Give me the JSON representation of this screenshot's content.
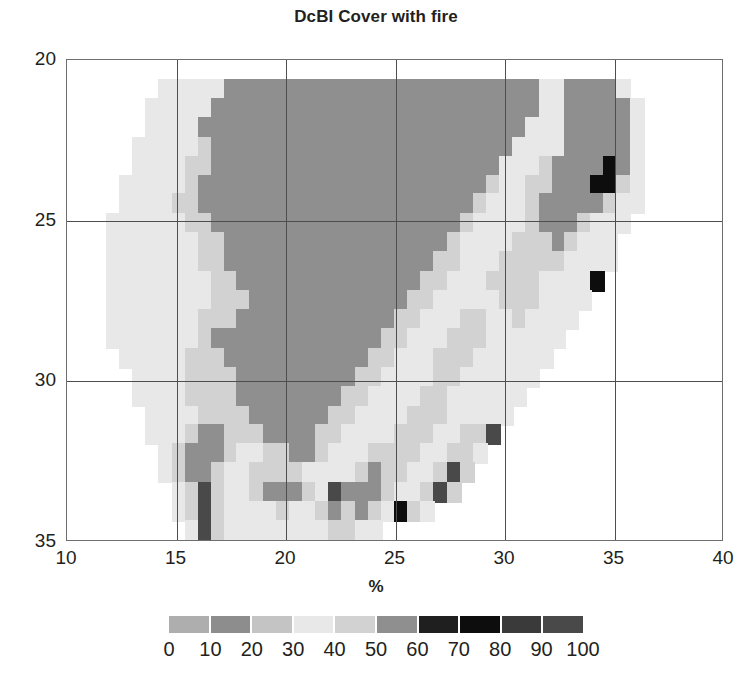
{
  "chart_data": {
    "type": "heatmap",
    "title": "DcBI Cover with fire",
    "xlabel": "%",
    "ylabel": "",
    "xlim": [
      10,
      40
    ],
    "ylim": [
      35,
      20
    ],
    "x_ticks": [
      10,
      15,
      20,
      25,
      30,
      35,
      40
    ],
    "y_ticks": [
      20,
      25,
      30,
      35
    ],
    "y_axis_inverted": true,
    "grid": true,
    "legend_position": "bottom",
    "colorbar": {
      "label": "%",
      "ticks": [
        0,
        10,
        20,
        30,
        40,
        50,
        60,
        70,
        80,
        90,
        100
      ],
      "segment_colors": [
        "#aeaeae",
        "#8d8d8d",
        "#c4c4c4",
        "#e8e8e8",
        "#d2d2d2",
        "#8f8f8f",
        "#1f1f1f",
        "#0d0d0d",
        "#3a3a3a",
        "#494949"
      ],
      "n_segments": 10,
      "vmin": 0,
      "vmax": 100
    },
    "cell_size_deg": 0.6,
    "grid_origin": [
      10.0,
      20.0
    ],
    "nodata_color": "#ffffff",
    "raster": {
      "ncols": 50,
      "nrows": 25,
      "nodata": -1,
      "values": [
        [
          -1,
          -1,
          -1,
          -1,
          -1,
          -1,
          -1,
          -1,
          -1,
          -1,
          -1,
          -1,
          -1,
          -1,
          -1,
          -1,
          -1,
          -1,
          -1,
          -1,
          -1,
          -1,
          -1,
          -1,
          -1,
          -1,
          -1,
          -1,
          -1,
          -1,
          -1,
          -1,
          -1,
          -1,
          -1,
          -1,
          -1,
          -1,
          -1,
          -1,
          -1,
          -1,
          -1,
          -1,
          -1,
          -1,
          -1,
          -1,
          -1,
          -1
        ],
        [
          -1,
          -1,
          -1,
          -1,
          -1,
          -1,
          -1,
          35,
          35,
          35,
          35,
          30,
          55,
          55,
          55,
          55,
          55,
          55,
          55,
          55,
          55,
          55,
          55,
          55,
          55,
          55,
          55,
          55,
          55,
          55,
          55,
          55,
          55,
          55,
          55,
          55,
          30,
          35,
          55,
          55,
          55,
          55,
          35,
          -1,
          -1,
          -1,
          -1,
          -1,
          -1,
          -1
        ],
        [
          -1,
          -1,
          -1,
          -1,
          -1,
          -1,
          35,
          35,
          30,
          35,
          30,
          55,
          55,
          55,
          55,
          55,
          55,
          55,
          55,
          55,
          55,
          55,
          55,
          55,
          55,
          55,
          55,
          55,
          55,
          55,
          55,
          55,
          55,
          55,
          55,
          55,
          35,
          30,
          55,
          55,
          55,
          55,
          55,
          35,
          -1,
          -1,
          -1,
          -1,
          -1,
          -1
        ],
        [
          -1,
          -1,
          -1,
          -1,
          -1,
          -1,
          30,
          30,
          30,
          35,
          55,
          55,
          55,
          55,
          55,
          55,
          55,
          55,
          55,
          55,
          55,
          55,
          55,
          55,
          55,
          55,
          55,
          55,
          55,
          55,
          55,
          55,
          55,
          55,
          55,
          35,
          30,
          35,
          55,
          55,
          55,
          55,
          55,
          35,
          -1,
          -1,
          -1,
          -1,
          -1,
          -1
        ],
        [
          -1,
          -1,
          -1,
          -1,
          -1,
          35,
          30,
          30,
          35,
          35,
          45,
          55,
          55,
          55,
          55,
          55,
          55,
          55,
          55,
          55,
          55,
          55,
          55,
          55,
          55,
          55,
          55,
          55,
          55,
          55,
          55,
          55,
          55,
          55,
          35,
          30,
          35,
          35,
          55,
          55,
          55,
          55,
          55,
          35,
          -1,
          -1,
          -1,
          -1,
          -1,
          -1
        ],
        [
          -1,
          -1,
          -1,
          -1,
          -1,
          30,
          30,
          30,
          35,
          45,
          45,
          55,
          55,
          55,
          55,
          55,
          55,
          55,
          55,
          55,
          55,
          55,
          55,
          55,
          55,
          55,
          55,
          55,
          55,
          55,
          55,
          55,
          55,
          35,
          30,
          35,
          45,
          55,
          55,
          55,
          55,
          75,
          55,
          30,
          -1,
          -1,
          -1,
          -1,
          -1,
          -1
        ],
        [
          -1,
          -1,
          -1,
          -1,
          30,
          30,
          30,
          35,
          35,
          45,
          55,
          55,
          55,
          55,
          55,
          55,
          55,
          55,
          55,
          55,
          55,
          55,
          55,
          55,
          55,
          55,
          55,
          55,
          55,
          55,
          55,
          55,
          45,
          30,
          35,
          45,
          45,
          55,
          55,
          55,
          75,
          75,
          45,
          30,
          -1,
          -1,
          -1,
          -1,
          -1,
          -1
        ],
        [
          -1,
          -1,
          -1,
          -1,
          30,
          30,
          35,
          35,
          45,
          45,
          55,
          55,
          55,
          55,
          55,
          55,
          55,
          55,
          55,
          55,
          55,
          55,
          55,
          55,
          55,
          55,
          55,
          55,
          55,
          55,
          55,
          45,
          30,
          35,
          35,
          45,
          55,
          55,
          55,
          55,
          55,
          45,
          35,
          30,
          -1,
          -1,
          -1,
          -1,
          -1,
          -1
        ],
        [
          -1,
          -1,
          -1,
          30,
          30,
          35,
          35,
          35,
          30,
          45,
          45,
          55,
          55,
          55,
          55,
          55,
          55,
          55,
          55,
          55,
          55,
          55,
          55,
          55,
          55,
          55,
          55,
          55,
          55,
          55,
          45,
          35,
          30,
          30,
          35,
          45,
          55,
          55,
          55,
          45,
          35,
          35,
          30,
          -1,
          -1,
          -1,
          -1,
          -1,
          -1,
          -1
        ],
        [
          -1,
          -1,
          -1,
          30,
          30,
          35,
          35,
          30,
          30,
          35,
          45,
          45,
          55,
          55,
          55,
          55,
          55,
          55,
          55,
          55,
          55,
          55,
          55,
          55,
          55,
          55,
          55,
          55,
          55,
          45,
          35,
          30,
          30,
          35,
          45,
          45,
          45,
          55,
          45,
          35,
          35,
          30,
          -1,
          -1,
          -1,
          -1,
          -1,
          -1,
          -1,
          -1
        ],
        [
          -1,
          -1,
          -1,
          30,
          35,
          35,
          30,
          30,
          30,
          35,
          45,
          45,
          55,
          55,
          55,
          55,
          55,
          55,
          55,
          55,
          55,
          55,
          55,
          55,
          55,
          55,
          55,
          55,
          45,
          45,
          35,
          30,
          35,
          45,
          45,
          45,
          45,
          45,
          35,
          35,
          30,
          35,
          -1,
          -1,
          -1,
          -1,
          -1,
          -1,
          -1,
          -1
        ],
        [
          -1,
          -1,
          -1,
          30,
          35,
          30,
          30,
          30,
          30,
          35,
          35,
          45,
          45,
          55,
          55,
          55,
          55,
          55,
          55,
          55,
          55,
          55,
          55,
          55,
          55,
          55,
          55,
          45,
          45,
          35,
          35,
          35,
          45,
          45,
          45,
          45,
          35,
          35,
          35,
          35,
          75,
          -1,
          -1,
          -1,
          -1,
          -1,
          -1,
          -1,
          -1,
          -1
        ],
        [
          -1,
          -1,
          -1,
          30,
          30,
          30,
          30,
          30,
          30,
          35,
          35,
          45,
          45,
          45,
          55,
          55,
          55,
          55,
          55,
          55,
          55,
          55,
          55,
          55,
          55,
          55,
          45,
          45,
          35,
          35,
          35,
          35,
          35,
          45,
          45,
          45,
          35,
          35,
          35,
          35,
          -1,
          -1,
          -1,
          -1,
          -1,
          -1,
          -1,
          -1,
          -1,
          -1
        ],
        [
          -1,
          -1,
          -1,
          30,
          30,
          30,
          30,
          30,
          35,
          35,
          45,
          45,
          45,
          55,
          55,
          55,
          55,
          55,
          55,
          55,
          55,
          55,
          55,
          55,
          55,
          45,
          45,
          35,
          35,
          35,
          45,
          45,
          35,
          35,
          45,
          35,
          35,
          35,
          35,
          -1,
          -1,
          -1,
          -1,
          -1,
          -1,
          -1,
          -1,
          -1,
          -1,
          -1
        ],
        [
          -1,
          -1,
          -1,
          30,
          30,
          30,
          30,
          35,
          35,
          35,
          45,
          55,
          55,
          55,
          55,
          55,
          55,
          55,
          55,
          55,
          55,
          55,
          55,
          55,
          45,
          45,
          35,
          35,
          35,
          45,
          45,
          45,
          35,
          35,
          35,
          35,
          35,
          35,
          -1,
          -1,
          -1,
          -1,
          -1,
          -1,
          -1,
          -1,
          -1,
          -1,
          -1,
          -1
        ],
        [
          -1,
          -1,
          -1,
          -1,
          30,
          30,
          30,
          35,
          35,
          45,
          45,
          45,
          55,
          55,
          55,
          55,
          55,
          55,
          55,
          55,
          55,
          55,
          55,
          45,
          45,
          35,
          35,
          35,
          45,
          45,
          45,
          35,
          35,
          35,
          35,
          35,
          35,
          -1,
          -1,
          -1,
          -1,
          -1,
          -1,
          -1,
          -1,
          -1,
          -1,
          -1,
          -1,
          -1
        ],
        [
          -1,
          -1,
          -1,
          -1,
          -1,
          30,
          30,
          35,
          35,
          45,
          45,
          45,
          45,
          55,
          55,
          55,
          55,
          55,
          55,
          55,
          55,
          55,
          45,
          45,
          35,
          35,
          35,
          35,
          45,
          45,
          35,
          35,
          35,
          35,
          35,
          35,
          -1,
          -1,
          -1,
          -1,
          -1,
          -1,
          -1,
          -1,
          -1,
          -1,
          -1,
          -1,
          -1,
          -1
        ],
        [
          -1,
          -1,
          -1,
          -1,
          -1,
          30,
          30,
          30,
          35,
          45,
          45,
          45,
          45,
          55,
          55,
          55,
          55,
          55,
          55,
          55,
          55,
          45,
          45,
          35,
          35,
          35,
          35,
          45,
          45,
          35,
          35,
          35,
          35,
          35,
          35,
          -1,
          -1,
          -1,
          -1,
          -1,
          -1,
          -1,
          -1,
          -1,
          -1,
          -1,
          -1,
          -1,
          -1,
          -1
        ],
        [
          -1,
          -1,
          -1,
          -1,
          -1,
          -1,
          30,
          30,
          35,
          35,
          45,
          45,
          45,
          45,
          55,
          55,
          55,
          55,
          55,
          55,
          45,
          45,
          35,
          35,
          35,
          35,
          45,
          45,
          45,
          35,
          35,
          35,
          35,
          35,
          -1,
          -1,
          -1,
          -1,
          -1,
          -1,
          -1,
          -1,
          -1,
          -1,
          -1,
          -1,
          -1,
          -1,
          -1,
          -1
        ],
        [
          -1,
          -1,
          -1,
          -1,
          -1,
          -1,
          30,
          30,
          35,
          45,
          55,
          55,
          45,
          45,
          45,
          55,
          55,
          55,
          55,
          45,
          45,
          35,
          35,
          35,
          35,
          45,
          45,
          45,
          35,
          35,
          45,
          45,
          95,
          -1,
          -1,
          -1,
          -1,
          -1,
          -1,
          -1,
          -1,
          -1,
          -1,
          -1,
          -1,
          -1,
          -1,
          -1,
          -1,
          -1
        ],
        [
          -1,
          -1,
          -1,
          -1,
          -1,
          -1,
          -1,
          30,
          45,
          55,
          55,
          55,
          45,
          35,
          35,
          45,
          45,
          55,
          55,
          45,
          35,
          35,
          35,
          45,
          45,
          45,
          45,
          35,
          35,
          45,
          45,
          35,
          -1,
          -1,
          -1,
          -1,
          -1,
          -1,
          -1,
          -1,
          -1,
          -1,
          -1,
          -1,
          -1,
          -1,
          -1,
          -1,
          -1,
          -1
        ],
        [
          -1,
          -1,
          -1,
          -1,
          -1,
          -1,
          -1,
          30,
          45,
          55,
          55,
          45,
          35,
          35,
          45,
          45,
          45,
          45,
          35,
          35,
          35,
          35,
          45,
          55,
          45,
          45,
          35,
          35,
          45,
          95,
          45,
          -1,
          -1,
          -1,
          -1,
          -1,
          -1,
          -1,
          -1,
          -1,
          -1,
          -1,
          -1,
          -1,
          -1,
          -1,
          -1,
          -1,
          -1,
          -1
        ],
        [
          -1,
          -1,
          -1,
          -1,
          -1,
          -1,
          -1,
          -1,
          35,
          45,
          95,
          45,
          35,
          35,
          45,
          55,
          55,
          55,
          45,
          35,
          95,
          55,
          55,
          55,
          45,
          35,
          35,
          45,
          95,
          45,
          -1,
          -1,
          -1,
          -1,
          -1,
          -1,
          -1,
          -1,
          -1,
          -1,
          -1,
          -1,
          -1,
          -1,
          -1,
          -1,
          -1,
          -1,
          -1,
          -1
        ],
        [
          -1,
          -1,
          -1,
          -1,
          -1,
          -1,
          -1,
          -1,
          35,
          45,
          95,
          45,
          35,
          30,
          35,
          35,
          45,
          35,
          35,
          45,
          55,
          45,
          55,
          45,
          35,
          75,
          45,
          35,
          -1,
          -1,
          -1,
          -1,
          -1,
          -1,
          -1,
          -1,
          -1,
          -1,
          -1,
          -1,
          -1,
          -1,
          -1,
          -1,
          -1,
          -1,
          -1,
          -1,
          -1,
          -1
        ],
        [
          -1,
          -1,
          -1,
          -1,
          -1,
          -1,
          -1,
          -1,
          -1,
          35,
          95,
          45,
          35,
          30,
          30,
          35,
          35,
          35,
          35,
          35,
          45,
          45,
          35,
          35,
          -1,
          -1,
          -1,
          -1,
          -1,
          -1,
          -1,
          -1,
          -1,
          -1,
          -1,
          -1,
          -1,
          -1,
          -1,
          -1,
          -1,
          -1,
          -1,
          -1,
          -1,
          -1,
          -1,
          -1,
          -1,
          -1
        ]
      ]
    }
  }
}
